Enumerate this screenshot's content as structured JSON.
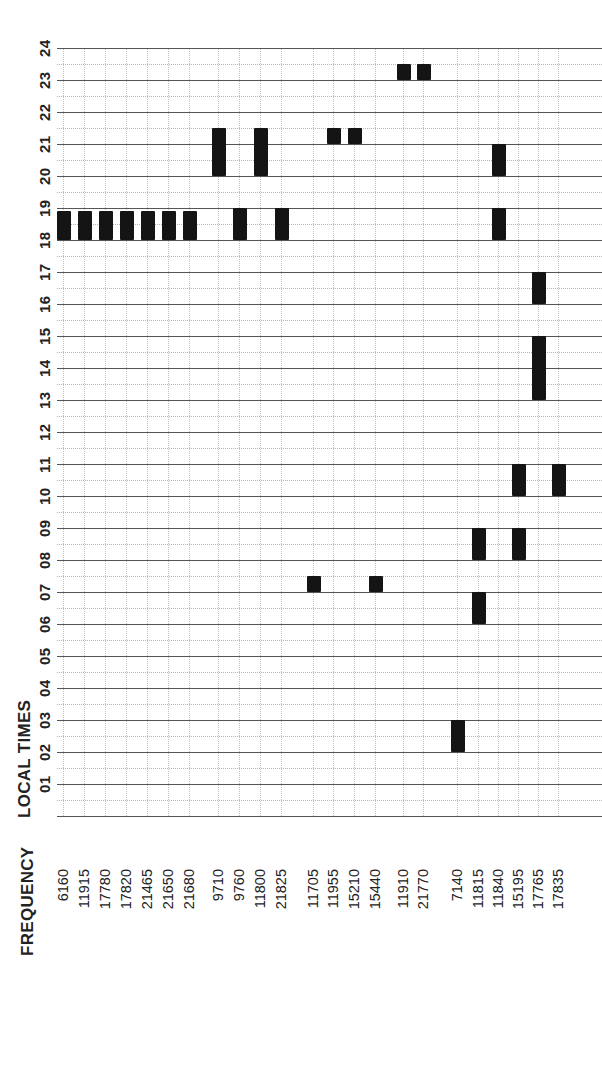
{
  "chart_data": {
    "type": "bar",
    "subtype": "timeline-schedule (broadcast frequency vs local time, rotated 90° CCW)",
    "title": "",
    "xlabel": "FREQUENCY",
    "ylabel": "LOCAL TIMES",
    "ylim": [
      0,
      24
    ],
    "y_ticks": [
      "01",
      "02",
      "03",
      "04",
      "05",
      "06",
      "07",
      "08",
      "09",
      "10",
      "11",
      "12",
      "13",
      "14",
      "15",
      "16",
      "17",
      "18",
      "19",
      "20",
      "21",
      "22",
      "23",
      "24"
    ],
    "grid": {
      "hour_lines": "solid",
      "half_hour_lines": "dotted",
      "frequency_lines": "dotted"
    },
    "categories": [
      "6160",
      "11915",
      "17780",
      "17820",
      "21465",
      "21650",
      "21680",
      "9710",
      "9760",
      "11800",
      "21825",
      "11705",
      "11955",
      "15210",
      "15440",
      "11910",
      "21770",
      "7140",
      "11815",
      "11840",
      "15195",
      "17765",
      "17835"
    ],
    "groups": [
      [
        "6160",
        "11915",
        "17780",
        "17820",
        "21465",
        "21650",
        "21680"
      ],
      [
        "9710",
        "9760",
        "11800",
        "21825"
      ],
      [
        "11705",
        "11955",
        "15210",
        "15440"
      ],
      [
        "11910",
        "21770"
      ],
      [
        "7140",
        "11815",
        "11840",
        "15195",
        "17765",
        "17835"
      ]
    ],
    "schedule": [
      {
        "frequency": "6160",
        "slots": [
          [
            18.0,
            18.9
          ]
        ]
      },
      {
        "frequency": "11915",
        "slots": [
          [
            18.0,
            18.9
          ]
        ]
      },
      {
        "frequency": "17780",
        "slots": [
          [
            18.0,
            18.9
          ]
        ]
      },
      {
        "frequency": "17820",
        "slots": [
          [
            18.0,
            18.9
          ]
        ]
      },
      {
        "frequency": "21465",
        "slots": [
          [
            18.0,
            18.9
          ]
        ]
      },
      {
        "frequency": "21650",
        "slots": [
          [
            18.0,
            18.9
          ]
        ]
      },
      {
        "frequency": "21680",
        "slots": [
          [
            18.0,
            18.9
          ]
        ]
      },
      {
        "frequency": "9710",
        "slots": [
          [
            20.0,
            21.5
          ]
        ]
      },
      {
        "frequency": "9760",
        "slots": [
          [
            18.0,
            19.0
          ]
        ]
      },
      {
        "frequency": "11800",
        "slots": [
          [
            20.0,
            21.5
          ]
        ]
      },
      {
        "frequency": "21825",
        "slots": [
          [
            18.0,
            19.0
          ]
        ]
      },
      {
        "frequency": "11705",
        "slots": [
          [
            7.0,
            7.5
          ]
        ]
      },
      {
        "frequency": "11955",
        "slots": [
          [
            21.0,
            21.5
          ]
        ]
      },
      {
        "frequency": "15210",
        "slots": [
          [
            21.0,
            21.5
          ]
        ]
      },
      {
        "frequency": "15440",
        "slots": [
          [
            7.0,
            7.5
          ]
        ]
      },
      {
        "frequency": "11910",
        "slots": [
          [
            23.0,
            23.5
          ]
        ]
      },
      {
        "frequency": "21770",
        "slots": [
          [
            23.0,
            23.5
          ]
        ]
      },
      {
        "frequency": "7140",
        "slots": [
          [
            2.0,
            3.0
          ]
        ]
      },
      {
        "frequency": "11815",
        "slots": [
          [
            6.0,
            7.0
          ],
          [
            8.0,
            9.0
          ]
        ]
      },
      {
        "frequency": "11840",
        "slots": [
          [
            18.0,
            19.0
          ],
          [
            20.0,
            21.0
          ]
        ]
      },
      {
        "frequency": "15195",
        "slots": [
          [
            8.0,
            9.0
          ],
          [
            10.0,
            11.0
          ]
        ]
      },
      {
        "frequency": "17765",
        "slots": [
          [
            13.0,
            15.0
          ],
          [
            16.0,
            17.0
          ]
        ]
      },
      {
        "frequency": "17835",
        "slots": [
          [
            10.0,
            11.0
          ]
        ]
      }
    ]
  },
  "layout": {
    "freq_x": {
      "6160": 64,
      "11915": 85,
      "17780": 106,
      "17820": 127,
      "21465": 148,
      "21650": 169,
      "21680": 190,
      "9710": 219,
      "9760": 240,
      "11800": 261,
      "21825": 282,
      "11705": 314,
      "11955": 334,
      "15210": 355,
      "15440": 376,
      "11910": 404,
      "21770": 424,
      "7140": 458,
      "11815": 479,
      "11840": 499,
      "15195": 519,
      "17765": 539,
      "17835": 559
    },
    "bar_color": "#141414"
  },
  "axis": {
    "y_title": "LOCAL TIMES",
    "x_title": "FREQUENCY"
  }
}
